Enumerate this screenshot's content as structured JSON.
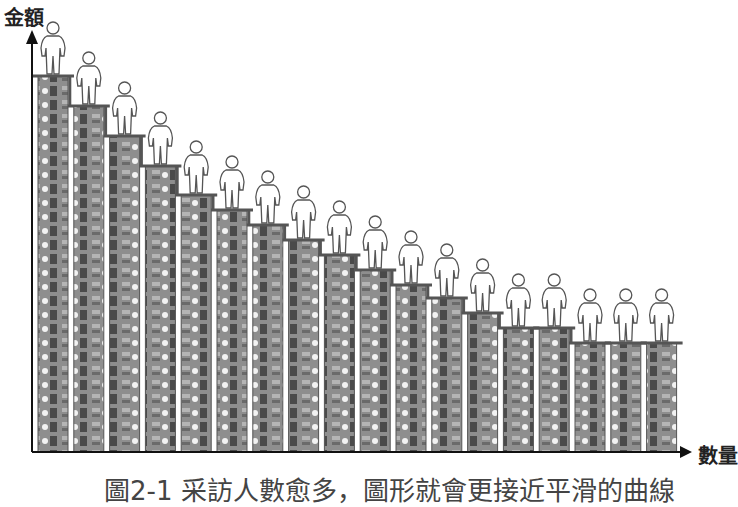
{
  "chart_data": {
    "type": "bar",
    "title": "",
    "xlabel": "數量",
    "ylabel": "金額",
    "caption": "圖2-1 采訪人數愈多，圖形就會更接近平滑的曲線",
    "categories": [
      "1",
      "2",
      "3",
      "4",
      "5",
      "6",
      "7",
      "8",
      "9",
      "10",
      "11",
      "12",
      "13",
      "14",
      "15",
      "16",
      "17",
      "18"
    ],
    "values": [
      376,
      346,
      316,
      286,
      257,
      242,
      227,
      212,
      197,
      182,
      167,
      154,
      139,
      124,
      124,
      109,
      109,
      109
    ],
    "value_note": "relative bar heights in pixels above x-axis; each bar is a stack of banknotes with a person figure on top",
    "grid": false,
    "legend": null
  },
  "colors": {
    "axis": "#111111",
    "bar_fill": "#8e8e8e",
    "bar_outline": "#555555",
    "person_stroke": "#555555"
  }
}
